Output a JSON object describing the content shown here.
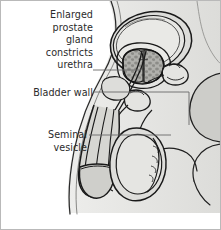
{
  "figure": {
    "type": "anatomical-illustration",
    "background_color": "#ffffff",
    "border_color": "#b9b9b9",
    "line_color": "#1a1a1a",
    "fill_light": "#e3e3e1",
    "fill_mid": "#c9c9c6",
    "fill_dark": "#a9a9a5",
    "text_color": "#2b2b2b",
    "leader_color": "#5e5e5e"
  },
  "labels": {
    "prostate": {
      "name": "enlarged-prostate-label",
      "text": "Enlarged\nprostate\ngland\nconstricts\nurethra",
      "lines": [
        "Enlarged",
        "prostate",
        "gland",
        "constricts",
        "urethra"
      ]
    },
    "bladder_wall": {
      "name": "bladder-wall-label",
      "text": "Bladder wall",
      "lines": [
        "Bladder wall"
      ]
    },
    "seminal_vesicle": {
      "name": "seminal-vesicle-label",
      "text": "Seminal\nvesicle",
      "lines": [
        "Seminal",
        "vesicle"
      ]
    }
  },
  "structures": [
    "bladder",
    "bladder-wall",
    "enlarged-prostate-gland",
    "urethra",
    "seminal-vesicle",
    "vas-deferens",
    "penis-shaft",
    "glans-penis",
    "testis",
    "scrotum",
    "pubic-bone",
    "rectum",
    "buttock-contour",
    "abdominal-wall-contour"
  ]
}
